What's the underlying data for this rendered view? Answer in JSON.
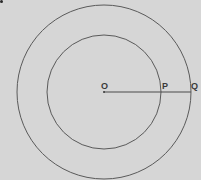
{
  "diagram": {
    "background": "#d6d6d6",
    "stroke": "#5a5a5a",
    "center": {
      "label": "O",
      "x": 104,
      "y": 92
    },
    "inner_circle": {
      "radius": 57
    },
    "outer_circle": {
      "radius": 87
    },
    "points": [
      {
        "label": "O",
        "x": 104,
        "y": 92
      },
      {
        "label": "P",
        "x": 161,
        "y": 92
      },
      {
        "label": "Q",
        "x": 191,
        "y": 92
      }
    ],
    "segment": {
      "from": "O",
      "to": "Q"
    }
  }
}
